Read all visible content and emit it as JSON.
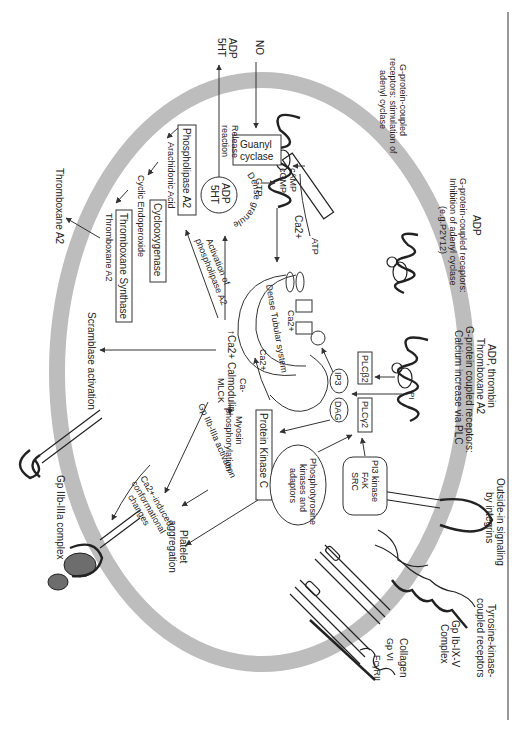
{
  "figure": {
    "orientation": "rotated 90 degrees clockwise",
    "membrane_color": "#bdbdbd",
    "line_color": "#333333",
    "frame_line": "right vertical rule"
  },
  "external": {
    "no": "NO",
    "adp_5ht_out": [
      "ADP",
      "5HT"
    ],
    "thromboxane_out": "Thromboxane A2",
    "gpcr_stim": [
      "G-protein-coupled",
      "receptors: stimulation of",
      "adenyl cyclase"
    ],
    "adp": "ADP",
    "gpcr_inhib": [
      "G-protein-coupled receptors:",
      "Inhibition of adenyl cyclase",
      "(e.g.P2Y12)"
    ],
    "adp_thrombin": [
      "ADP, thrombin",
      "Thromboxane A2",
      "G-protein coupled receptors:",
      "Calcium increase via PLC"
    ],
    "outside_in": [
      "Outside-in signaling",
      "by integrins"
    ],
    "tyrosine": [
      "Tyrosine-kinase-",
      "coupled receptors"
    ],
    "gp_ib": [
      "Gp Ib-IX-V",
      "Complex"
    ],
    "collagen": "Collagen",
    "gp_vi": "Gp VI",
    "fc": "FcγRII",
    "gp_iib_complex": "Gp IIb-IIIa complex"
  },
  "internal": {
    "guanyl_cyclase": [
      "Guanyl",
      "cyclase"
    ],
    "release_reaction": [
      "Release",
      "reaction"
    ],
    "gtp": "GTP",
    "camp": "cAMP",
    "cgmp": "cGMP",
    "atp": "ATP",
    "ca_top": "Ca2+",
    "dense_granule": "Dense granule",
    "granule_contents": [
      "ADP",
      "5HT"
    ],
    "phospholipase": "Phospholipase A2",
    "arachidonic": "Arachidonic Acid",
    "cyclooxygenase": "Cyclooxygenase",
    "endoperoxide": "Cyclic Endoperoxide",
    "tx_synthase": "Thromboxane Synthase",
    "tx_a2": "Thromboxane A2",
    "activation_pla2": [
      "Activation of",
      "phospholipase A2"
    ],
    "dts": "Dense Tubular system",
    "ca_inner": "Ca2+",
    "ca_release": "Ca2+",
    "ca_calmodulin": [
      "Ca-",
      "↑Ca2+ Calmodulin",
      "MLCK"
    ],
    "myosin": [
      "Myosin",
      "phosphorylation"
    ],
    "scramblase": "Scramblase activation",
    "gp_iib_activation": "Gp IIb-IIIa activation",
    "ca_induced": [
      "Ca2+-induced",
      "conformational",
      "changes"
    ],
    "platelet_agg": [
      "Platelet",
      "aggregation"
    ],
    "ip3": "IP3",
    "dag": "DAG",
    "plcb2": "PLCβ2",
    "plcg2": "PLCγ2",
    "pi": "PI",
    "pkc": "Protein Kinase C",
    "phosphotyrosine": [
      "Phosphotyrosine",
      "kinases and",
      "adaptors"
    ],
    "pi3k": [
      "PI3 kinase",
      "FAK",
      "SRC"
    ]
  }
}
